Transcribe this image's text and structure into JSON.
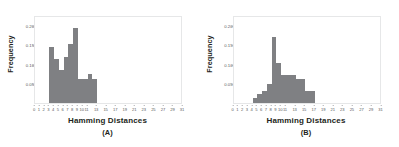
{
  "figure": {
    "background": "#ffffff",
    "bar_color": "#7f8083",
    "axis_color": "#58595b",
    "frame_color": "#e6e7e8"
  },
  "panels": [
    {
      "id": "A",
      "caption": "(A)",
      "ylabel": "Frequency",
      "xlabel": "Hamming Distances"
    },
    {
      "id": "B",
      "caption": "(B)",
      "ylabel": "Frequency",
      "xlabel": "Hamming Distances"
    }
  ],
  "chart_data": [
    {
      "type": "bar",
      "title": "",
      "panel": "(A)",
      "xlabel": "Hamming Distances",
      "ylabel": "Frequency",
      "xlim": [
        0,
        31
      ],
      "ylim": [
        0,
        0.225
      ],
      "yticks": [
        0.05,
        0.1,
        0.15,
        0.2
      ],
      "ytick_labels": [
        "0.05",
        "0.10",
        "0.15",
        "0.20"
      ],
      "xticks": [
        0,
        1,
        2,
        3,
        4,
        5,
        6,
        7,
        8,
        9,
        10,
        11,
        13,
        15,
        17,
        19,
        21,
        23,
        25,
        27,
        29,
        31
      ],
      "xtick_labels": [
        "0",
        "1",
        "2",
        "3",
        "4",
        "5",
        "6",
        "7",
        "8",
        "9",
        "10",
        "11",
        "13",
        "15",
        "17",
        "19",
        "21",
        "23",
        "25",
        "27",
        "29",
        "31"
      ],
      "grid": false,
      "legend": null,
      "categories": [
        3,
        4,
        5,
        6,
        7,
        8,
        9,
        10,
        11,
        12
      ],
      "values": [
        0.142,
        0.112,
        0.085,
        0.118,
        0.152,
        0.192,
        0.062,
        0.062,
        0.075,
        0.062
      ]
    },
    {
      "type": "bar",
      "title": "",
      "panel": "(B)",
      "xlabel": "Hamming Distances",
      "ylabel": "Frequency",
      "xlim": [
        0,
        31
      ],
      "ylim": [
        0,
        0.225
      ],
      "yticks": [
        0.05,
        0.1,
        0.15,
        0.2
      ],
      "ytick_labels": [
        "0.05",
        "0.10",
        "0.15",
        "0.20"
      ],
      "xticks": [
        0,
        1,
        2,
        3,
        4,
        5,
        6,
        7,
        8,
        9,
        10,
        11,
        13,
        15,
        17,
        19,
        21,
        23,
        25,
        27,
        29,
        31
      ],
      "xtick_labels": [
        "0",
        "1",
        "2",
        "3",
        "4",
        "5",
        "6",
        "7",
        "8",
        "9",
        "10",
        "11",
        "13",
        "15",
        "17",
        "19",
        "21",
        "23",
        "25",
        "27",
        "29",
        "31"
      ],
      "grid": false,
      "legend": null,
      "categories": [
        4,
        5,
        6,
        7,
        8,
        9,
        10,
        11,
        12,
        13,
        14,
        15,
        16
      ],
      "values": [
        0.012,
        0.022,
        0.03,
        0.048,
        0.168,
        0.102,
        0.072,
        0.072,
        0.072,
        0.062,
        0.062,
        0.03,
        0.03
      ]
    }
  ]
}
